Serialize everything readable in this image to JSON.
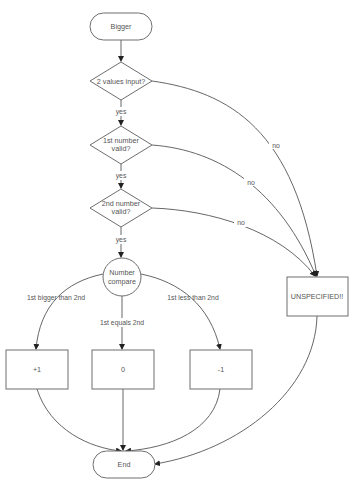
{
  "diagram": {
    "title": "Bigger",
    "nodes": {
      "start": {
        "label": "Bigger",
        "shape": "terminator"
      },
      "d1": {
        "line1": "2 values input?",
        "shape": "decision"
      },
      "d2": {
        "line1": "1st number",
        "line2": "valid?",
        "shape": "decision"
      },
      "d3": {
        "line1": "2nd number",
        "line2": "valid?",
        "shape": "decision"
      },
      "cmp": {
        "line1": "Number",
        "line2": "compare",
        "shape": "circle"
      },
      "plus": {
        "label": "+1",
        "shape": "process"
      },
      "zero": {
        "label": "0",
        "shape": "process"
      },
      "minus": {
        "label": "-1",
        "shape": "process"
      },
      "unspec": {
        "label": "UNSPECIFIED!!",
        "shape": "process"
      },
      "end": {
        "label": "End",
        "shape": "terminator"
      }
    },
    "edges": {
      "d1_yes": "yes",
      "d2_yes": "yes",
      "d3_yes": "yes",
      "d1_no": "no",
      "d2_no": "no",
      "d3_no": "no",
      "bigger": "1st bigger than 2nd",
      "equals": "1st equals 2nd",
      "less": "1st less than 2nd"
    },
    "colors": {
      "stroke": "#6e6e6e",
      "text": "#555555",
      "background": "#ffffff"
    }
  }
}
